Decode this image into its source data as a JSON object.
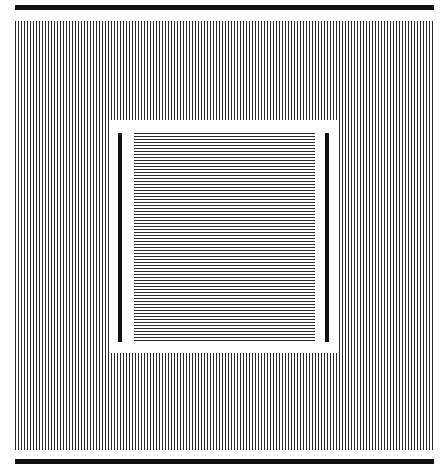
{
  "figure": {
    "colors": {
      "background": "#ffffff",
      "lines": "#2a2a2a",
      "bars": "#111111"
    },
    "outer_grating": {
      "orientation": "vertical",
      "period_px": 3
    },
    "inner_grating": {
      "orientation": "horizontal",
      "period_px": 3
    }
  }
}
